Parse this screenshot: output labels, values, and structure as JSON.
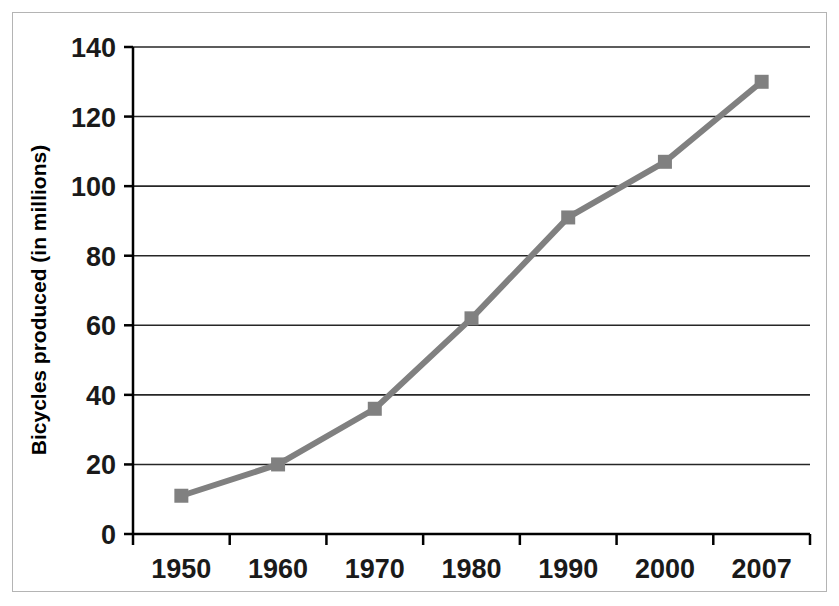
{
  "chart_data": {
    "type": "line",
    "title": "",
    "subtitle": "",
    "xlabel": "",
    "ylabel": "Bicycles produced (in millions)",
    "categories": [
      "1950",
      "1960",
      "1970",
      "1980",
      "1990",
      "2000",
      "2007"
    ],
    "x": [
      1950,
      1960,
      1970,
      1980,
      1990,
      2000,
      2007
    ],
    "values": [
      11,
      20,
      36,
      62,
      91,
      107,
      130
    ],
    "series": [
      {
        "name": "Bicycles produced",
        "values": [
          11,
          20,
          36,
          62,
          91,
          107,
          130
        ]
      }
    ],
    "ylim": [
      0,
      140
    ],
    "y_ticks": [
      0,
      20,
      40,
      60,
      80,
      100,
      120,
      140
    ],
    "y_tick_labels": [
      "0",
      "20",
      "40",
      "60",
      "80",
      "100",
      "120",
      "140"
    ],
    "x_tick_labels": [
      "1950",
      "1960",
      "1970",
      "1980",
      "1990",
      "2000",
      "2007"
    ],
    "grid": "horizontal",
    "legend": "none",
    "legend_position": "none",
    "annotations": [],
    "colors": {
      "line": "#808080",
      "marker": "#808080",
      "grid": "#262626",
      "axis": "#000000",
      "text": "#1a1a1a",
      "background": "#ffffff",
      "frame_border": "#b4b4b4"
    },
    "marker_shape": "square",
    "line_width": 6,
    "marker_size": 14
  }
}
